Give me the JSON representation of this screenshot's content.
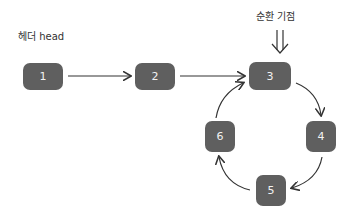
{
  "diagram": {
    "head_label": "헤더 head",
    "cycle_label": "순환 기점",
    "cycle_arrow_icon": "double-down-arrow",
    "nodes": [
      {
        "id": "1",
        "label": "1"
      },
      {
        "id": "2",
        "label": "2"
      },
      {
        "id": "3",
        "label": "3"
      },
      {
        "id": "4",
        "label": "4"
      },
      {
        "id": "5",
        "label": "5"
      },
      {
        "id": "6",
        "label": "6"
      }
    ],
    "edges": [
      {
        "from": "1",
        "to": "2"
      },
      {
        "from": "2",
        "to": "3"
      },
      {
        "from": "3",
        "to": "4"
      },
      {
        "from": "4",
        "to": "5"
      },
      {
        "from": "5",
        "to": "6"
      },
      {
        "from": "6",
        "to": "3"
      }
    ],
    "colors": {
      "node_fill": "#5f5f5f",
      "node_text": "#f2f2f2",
      "edge": "#333333"
    }
  }
}
